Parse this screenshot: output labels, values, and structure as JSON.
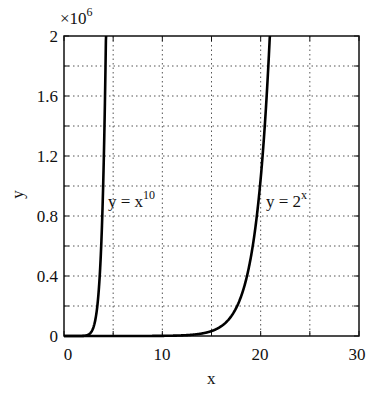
{
  "chart_data": {
    "type": "line",
    "title": "",
    "xlabel": "x",
    "ylabel": "y",
    "y_multiplier": "×10^6",
    "xlim": [
      0,
      30
    ],
    "ylim": [
      0,
      2000000
    ],
    "grid": true,
    "grid_style": "dotted",
    "x_ticks": [
      0,
      5,
      10,
      15,
      20,
      25,
      30
    ],
    "x_tick_labels": [
      "0",
      "",
      "10",
      "",
      "20",
      "",
      "30"
    ],
    "y_ticks": [
      0,
      0.2,
      0.4,
      0.6,
      0.8,
      1.0,
      1.2,
      1.4,
      1.6,
      1.8,
      2.0
    ],
    "y_tick_labels": [
      "0",
      "",
      "0.4",
      "",
      "0.8",
      "",
      "1.2",
      "",
      "1.6",
      "",
      "2"
    ],
    "series": [
      {
        "name": "y = x^10",
        "function": "x^10",
        "x": [
          0,
          1,
          2,
          2.5,
          3,
          3.5,
          4.0
        ],
        "values": [
          0,
          1,
          1024,
          9537,
          59049,
          275855,
          1048576
        ]
      },
      {
        "name": "y = 2^x",
        "function": "2^x",
        "x": [
          0,
          5,
          10,
          15,
          17,
          18,
          19,
          20,
          20.93
        ],
        "values": [
          1,
          32,
          1024,
          32768,
          131072,
          262144,
          524288,
          1048576,
          2000000
        ]
      }
    ],
    "annotations": [
      {
        "text": "y = x",
        "sup": "10",
        "x": 4.3,
        "y": 820000
      },
      {
        "text": "y = 2",
        "sup": "x",
        "x": 20.2,
        "y": 820000
      }
    ]
  },
  "labels": {
    "multiplier_base": "×10",
    "multiplier_exp": "6",
    "xlabel": "x",
    "ylabel": "y",
    "yticks": [
      "2",
      "1.6",
      "1.2",
      "0.8",
      "0.4",
      "0"
    ],
    "xticks": [
      "0",
      "10",
      "20",
      "30"
    ],
    "ann1_base": "y = x",
    "ann1_exp": "10",
    "ann2_base": "y = 2",
    "ann2_exp": "x"
  }
}
